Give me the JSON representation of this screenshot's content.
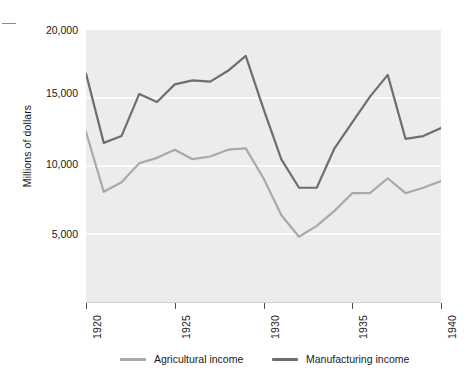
{
  "figure": {
    "corner_mark": "tick-mark",
    "ylabel": "Millions of dollars",
    "y_ticks": [
      "20,000",
      "15,000",
      "10,000",
      "5,000"
    ],
    "x_ticks": [
      "1920",
      "1925",
      "1930",
      "1935",
      "1940"
    ],
    "plot_bg_color": "#ececec",
    "gridline_color": "#ffffff"
  },
  "legend": {
    "entries": [
      {
        "label": "Agricultural income",
        "color": "#a9a9a9"
      },
      {
        "label": "Manufacturing income",
        "color": "#6e6e6e"
      }
    ]
  },
  "chart_data": {
    "type": "line",
    "title": "",
    "subtitle": "",
    "xlabel": "",
    "ylabel": "Millions of dollars",
    "xlim": [
      1920,
      1940
    ],
    "ylim": [
      0,
      20000
    ],
    "ytick_values": [
      20000,
      15000,
      10000,
      5000
    ],
    "xtick_values": [
      1920,
      1925,
      1930,
      1935,
      1940
    ],
    "grid": "horizontal",
    "legend_position": "below",
    "x": [
      1920,
      1921,
      1922,
      1923,
      1924,
      1925,
      1926,
      1927,
      1928,
      1929,
      1930,
      1931,
      1932,
      1933,
      1934,
      1935,
      1936,
      1937,
      1938,
      1939,
      1940
    ],
    "series": [
      {
        "name": "Agricultural income",
        "color": "#a9a9a9",
        "values": [
          12500,
          8100,
          8800,
          10200,
          10600,
          11200,
          10500,
          10700,
          11200,
          11300,
          9100,
          6400,
          4800,
          5600,
          6700,
          8000,
          8000,
          9100,
          8000,
          8400,
          8900
        ]
      },
      {
        "name": "Manufacturing income",
        "color": "#6e6e6e",
        "values": [
          16800,
          11700,
          12200,
          15300,
          14700,
          16000,
          16300,
          16200,
          17000,
          18100,
          14200,
          10500,
          8400,
          8400,
          11300,
          13200,
          15100,
          16700,
          12000,
          12200,
          12800
        ]
      }
    ]
  }
}
